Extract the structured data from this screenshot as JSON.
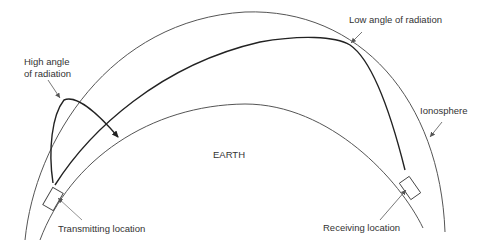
{
  "diagram": {
    "labels": {
      "high_angle_line1": "High angle",
      "high_angle_line2": "of radiation",
      "low_angle": "Low angle of radiation",
      "ionosphere": "Ionosphere",
      "earth": "EARTH",
      "transmitting": "Transmitting location",
      "receiving": "Receiving location"
    },
    "colors": {
      "ionosphere_line": "#555555",
      "earth_line": "#555555",
      "path_line": "#222222",
      "leader_line": "#555555",
      "text": "#333333"
    }
  }
}
